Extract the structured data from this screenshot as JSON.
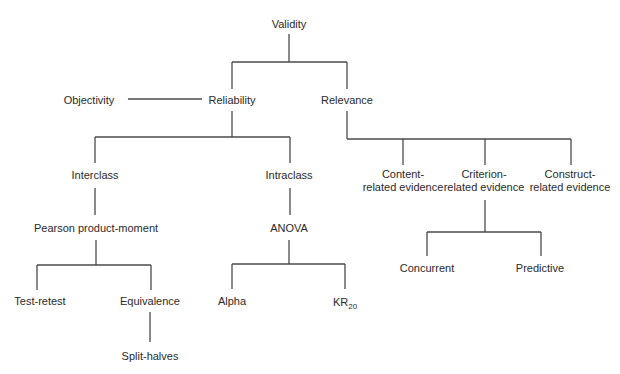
{
  "diagram": {
    "title": "Validity",
    "line_color": "#4a4a4a",
    "nodes": {
      "validity": {
        "label": "Validity",
        "x": 289,
        "y": 24
      },
      "objectivity": {
        "label": "Objectivity",
        "x": 89,
        "y": 100
      },
      "reliability": {
        "label": "Reliability",
        "x": 232,
        "y": 100
      },
      "relevance": {
        "label": "Relevance",
        "x": 347,
        "y": 100
      },
      "interclass": {
        "label": "Interclass",
        "x": 95,
        "y": 175
      },
      "intraclass": {
        "label": "Intraclass",
        "x": 289,
        "y": 175
      },
      "pearson": {
        "label": "Pearson product-moment",
        "x": 96,
        "y": 228
      },
      "anova": {
        "label": "ANOVA",
        "x": 289,
        "y": 228
      },
      "test_retest": {
        "label": "Test-retest",
        "x": 40,
        "y": 301
      },
      "equivalence": {
        "label": "Equivalence",
        "x": 150,
        "y": 301
      },
      "split_halves": {
        "label": "Split-halves",
        "x": 150,
        "y": 356
      },
      "alpha": {
        "label": "Alpha",
        "x": 232,
        "y": 301
      },
      "kr20": {
        "label": "KR",
        "subscript": "20",
        "x": 345,
        "y": 302
      },
      "content": {
        "label_line1": "Content-",
        "label_line2": "related evidence",
        "x": 403,
        "y": 181
      },
      "criterion": {
        "label_line1": "Criterion-",
        "label_line2": "related evidence",
        "x": 484,
        "y": 181
      },
      "construct": {
        "label_line1": "Construct-",
        "label_line2": "related evidence",
        "x": 570,
        "y": 181
      },
      "concurrent": {
        "label": "Concurrent",
        "x": 427,
        "y": 268
      },
      "predictive": {
        "label": "Predictive",
        "x": 540,
        "y": 268
      }
    },
    "edges": [
      [
        "Validity",
        "Reliability"
      ],
      [
        "Validity",
        "Relevance"
      ],
      [
        "Objectivity",
        "Reliability"
      ],
      [
        "Reliability",
        "Interclass"
      ],
      [
        "Reliability",
        "Intraclass"
      ],
      [
        "Interclass",
        "Pearson product-moment"
      ],
      [
        "Pearson product-moment",
        "Test-retest"
      ],
      [
        "Pearson product-moment",
        "Equivalence"
      ],
      [
        "Equivalence",
        "Split-halves"
      ],
      [
        "Intraclass",
        "ANOVA"
      ],
      [
        "ANOVA",
        "Alpha"
      ],
      [
        "ANOVA",
        "KR20"
      ],
      [
        "Relevance",
        "Content-related evidence"
      ],
      [
        "Relevance",
        "Criterion-related evidence"
      ],
      [
        "Relevance",
        "Construct-related evidence"
      ],
      [
        "Criterion-related evidence",
        "Concurrent"
      ],
      [
        "Criterion-related evidence",
        "Predictive"
      ]
    ]
  }
}
